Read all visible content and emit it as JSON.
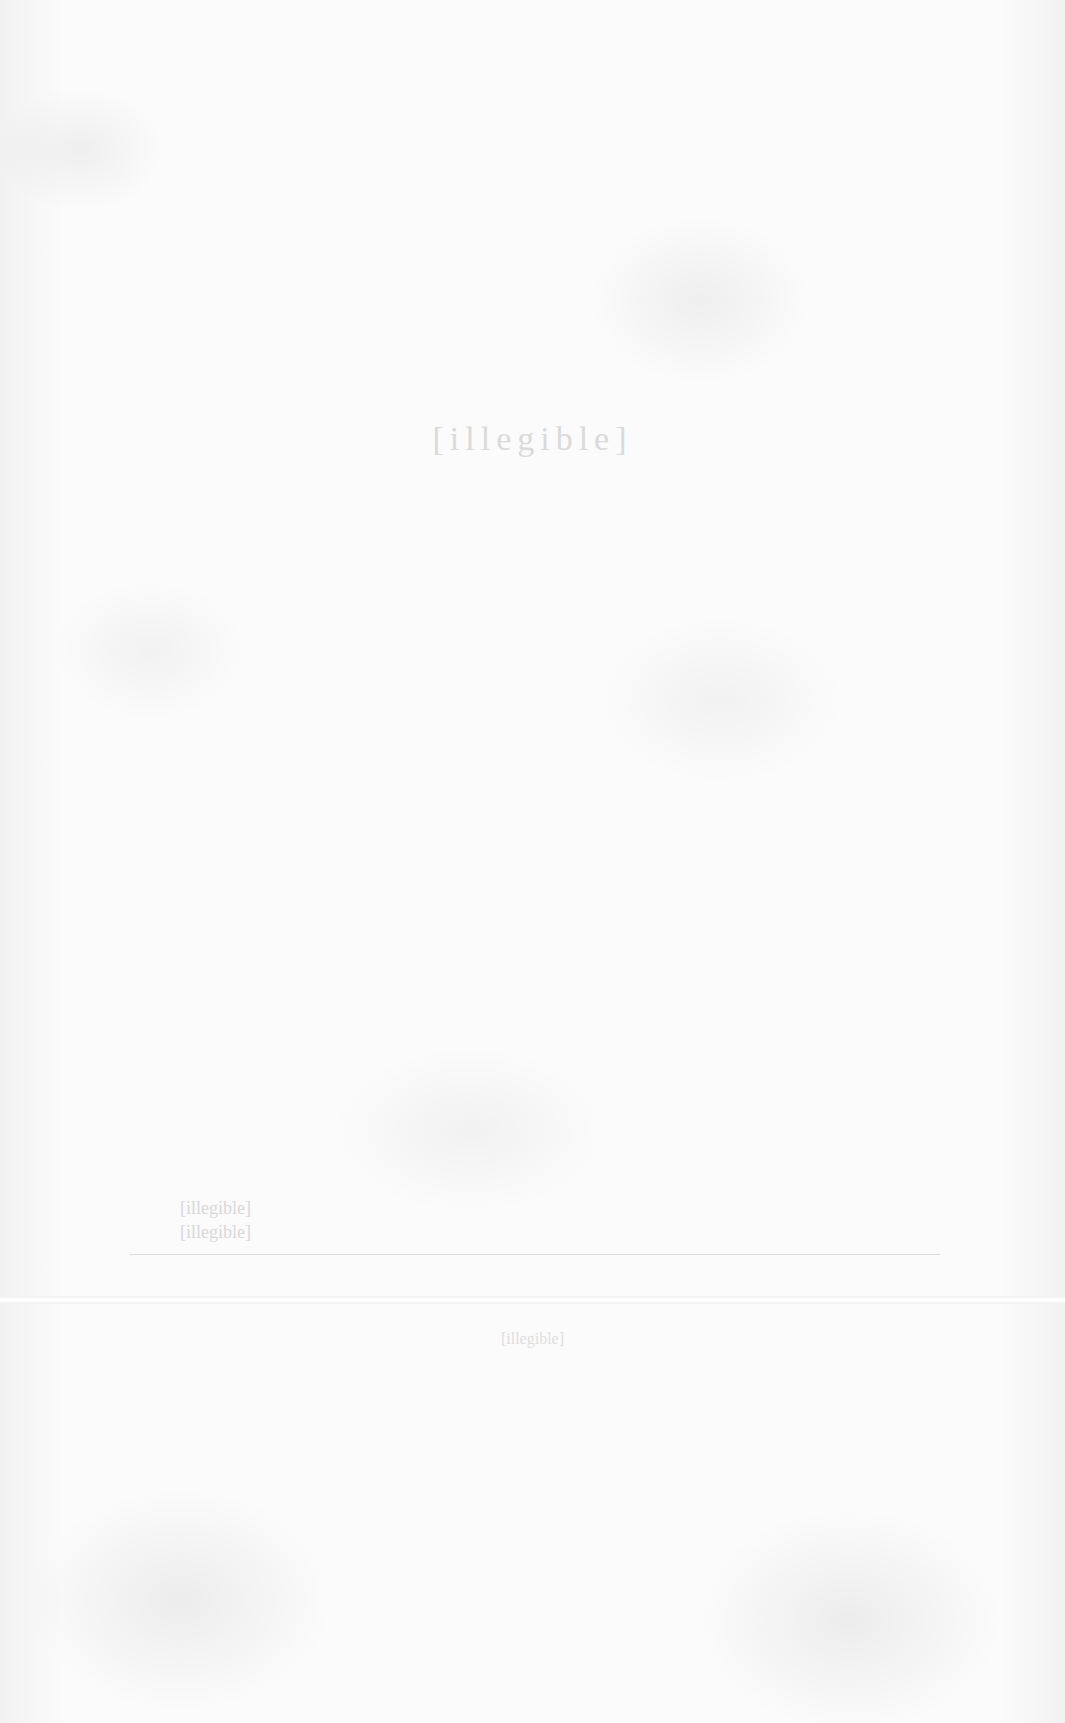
{
  "page": {
    "heading": "[illegible]",
    "body_lines": [
      "[illegible]",
      "[illegible]"
    ],
    "footer": "[illegible]",
    "colors": {
      "paper": "#fbfbfb",
      "ink_faded": "#d4d4d4"
    }
  }
}
